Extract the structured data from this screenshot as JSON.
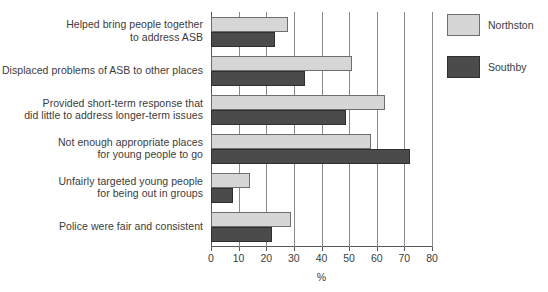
{
  "chart_data": {
    "type": "bar",
    "orientation": "horizontal",
    "title": "",
    "xlabel": "%",
    "ylabel": "",
    "xlim": [
      0,
      80
    ],
    "xticks": [
      0,
      10,
      20,
      30,
      40,
      50,
      60,
      70,
      80
    ],
    "grid": "vertical",
    "legend_position": "right",
    "categories": [
      "Helped bring people together\nto address ASB",
      "Displaced problems of ASB to other places",
      "Provided short-term response that\ndid little to address longer-term issues",
      "Not enough appropriate places\nfor young people to go",
      "Unfairly targeted young people\nfor being out in groups",
      "Police were fair and consistent"
    ],
    "series": [
      {
        "name": "Northston",
        "color": "#d6d6d6",
        "values": [
          28,
          51,
          63,
          58,
          14,
          29
        ]
      },
      {
        "name": "Southby",
        "color": "#4b4b4b",
        "values": [
          23,
          34,
          49,
          72,
          8,
          22
        ]
      }
    ]
  },
  "legend": {
    "items": [
      {
        "label": "Northston",
        "swatch": "light"
      },
      {
        "label": "Southby",
        "swatch": "dark"
      }
    ]
  },
  "axis": {
    "title": "%",
    "tick_labels": [
      "0",
      "10",
      "20",
      "30",
      "40",
      "50",
      "60",
      "70",
      "80"
    ]
  },
  "top_clipped_text": {
    "left": "",
    "right": ""
  }
}
